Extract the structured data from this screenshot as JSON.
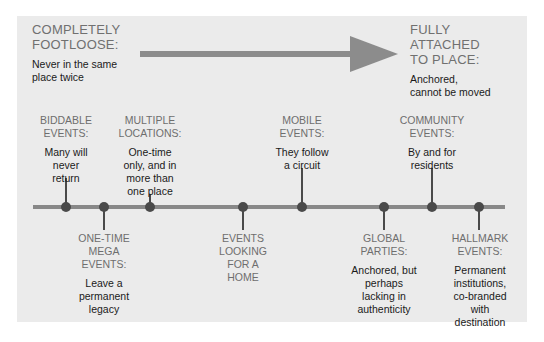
{
  "colors": {
    "background": "#ebebeb",
    "arrow": "#8c8c8c",
    "timeline": "#888888",
    "dot": "#4a4a4a",
    "heading": "#707070",
    "text": "#1a1a1a"
  },
  "left_end": {
    "title_line1": "COMPLETELY",
    "title_line2": "FOOTLOOSE:",
    "desc_line1": "Never in the same",
    "desc_line2": "place twice"
  },
  "right_end": {
    "title_line1": "FULLY",
    "title_line2": "ATTACHED",
    "title_line3": "TO PLACE:",
    "desc_line1": "Anchored,",
    "desc_line2": "cannot be moved"
  },
  "arrow": {
    "icon": "right-arrow-icon"
  },
  "events": [
    {
      "title": [
        "BIDDABLE",
        "EVENTS:"
      ],
      "desc": [
        "Many will",
        "never",
        "return"
      ],
      "position": "above"
    },
    {
      "title": [
        "ONE-TIME",
        "MEGA",
        "EVENTS:"
      ],
      "desc": [
        "Leave a",
        "permanent",
        "legacy"
      ],
      "position": "below"
    },
    {
      "title": [
        "MULTIPLE",
        "LOCATIONS:"
      ],
      "desc": [
        "One-time",
        "only, and in",
        "more than",
        "one place"
      ],
      "position": "above"
    },
    {
      "title": [
        "EVENTS",
        "LOOKING",
        "FOR A",
        "HOME"
      ],
      "desc": [],
      "position": "below"
    },
    {
      "title": [
        "MOBILE",
        "EVENTS:"
      ],
      "desc": [
        "They follow",
        "a circuit"
      ],
      "position": "above"
    },
    {
      "title": [
        "GLOBAL",
        "PARTIES:"
      ],
      "desc": [
        "Anchored, but",
        "perhaps",
        "lacking in",
        "authenticity"
      ],
      "position": "below"
    },
    {
      "title": [
        "COMMUNITY",
        "EVENTS:"
      ],
      "desc": [
        "By and for",
        "residents"
      ],
      "position": "above"
    },
    {
      "title": [
        "HALLMARK",
        "EVENTS:"
      ],
      "desc": [
        "Permanent",
        "institutions,",
        "co-branded",
        "with",
        "destination"
      ],
      "position": "below"
    }
  ]
}
